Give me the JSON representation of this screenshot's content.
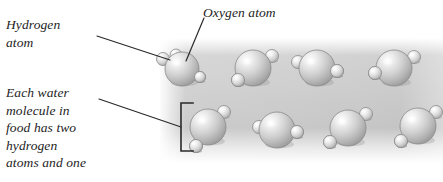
{
  "figure": {
    "kind": "water-molecules-in-food-diagram",
    "background_color": "#ffffff",
    "panel_color": "#c8c8c8",
    "line_color": "#2a2a2a",
    "text_color": "#1d1d1d"
  },
  "labels": {
    "hydrogen": "Hydrogen\natom",
    "oxygen": "Oxygen atom",
    "paragraph": "Each water\nmolecule in\nfood has two\nhydrogen\natoms and one"
  },
  "panel": {
    "x": 160,
    "y": 38,
    "width": 283,
    "height": 125
  },
  "bracket": {
    "x": 181,
    "y": 103,
    "width": 12,
    "height": 48
  },
  "leaders": [
    {
      "name": "hydrogen-leader",
      "x1": 97,
      "y1": 36,
      "x2": 170,
      "y2": 60
    },
    {
      "name": "oxygen-leader",
      "x1": 204,
      "y1": 18,
      "x2": 186,
      "y2": 61
    },
    {
      "name": "paragraph-leader",
      "x1": 99,
      "y1": 99,
      "x2": 181,
      "y2": 127
    }
  ],
  "molecules": [
    {
      "id": "m1",
      "row": "top",
      "cx": 182,
      "cy": 69,
      "r": 17,
      "hydrogens": [
        {
          "cx": 163,
          "cy": 59,
          "r": 6.5
        },
        {
          "cx": 176,
          "cy": 55,
          "r": 6.0
        },
        {
          "cx": 200,
          "cy": 77,
          "r": 5.5
        }
      ]
    },
    {
      "id": "m2",
      "row": "top",
      "cx": 253,
      "cy": 68,
      "r": 18,
      "hydrogens": [
        {
          "cx": 272,
          "cy": 56,
          "r": 6.5
        },
        {
          "cx": 238,
          "cy": 80,
          "r": 6.5
        }
      ]
    },
    {
      "id": "m3",
      "row": "top",
      "cx": 317,
      "cy": 68,
      "r": 18,
      "hydrogens": [
        {
          "cx": 298,
          "cy": 62,
          "r": 6.5
        },
        {
          "cx": 337,
          "cy": 71,
          "r": 6.5
        }
      ]
    },
    {
      "id": "m4",
      "row": "top",
      "cx": 394,
      "cy": 68,
      "r": 18,
      "hydrogens": [
        {
          "cx": 414,
          "cy": 57,
          "r": 6.5
        },
        {
          "cx": 375,
          "cy": 73,
          "r": 6.5
        }
      ]
    },
    {
      "id": "m5",
      "row": "bottom",
      "cx": 208,
      "cy": 127,
      "r": 18,
      "hydrogens": [
        {
          "cx": 224,
          "cy": 112,
          "r": 6.5
        },
        {
          "cx": 196,
          "cy": 146,
          "r": 6.5
        }
      ]
    },
    {
      "id": "m6",
      "row": "bottom",
      "cx": 277,
      "cy": 130,
      "r": 18,
      "hydrogens": [
        {
          "cx": 259,
          "cy": 127,
          "r": 6.5
        },
        {
          "cx": 297,
          "cy": 132,
          "r": 6.5
        }
      ]
    },
    {
      "id": "m7",
      "row": "bottom",
      "cx": 348,
      "cy": 128,
      "r": 18,
      "hydrogens": [
        {
          "cx": 366,
          "cy": 114,
          "r": 6.5
        },
        {
          "cx": 330,
          "cy": 142,
          "r": 6.5
        }
      ]
    },
    {
      "id": "m8",
      "row": "bottom",
      "cx": 418,
      "cy": 126,
      "r": 18,
      "hydrogens": [
        {
          "cx": 436,
          "cy": 112,
          "r": 6.5
        },
        {
          "cx": 401,
          "cy": 141,
          "r": 6.5
        }
      ]
    }
  ]
}
